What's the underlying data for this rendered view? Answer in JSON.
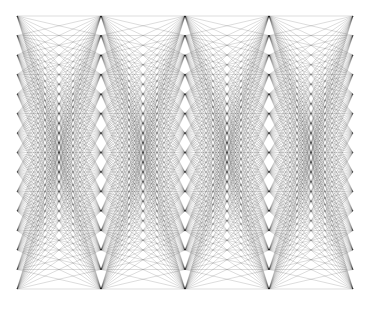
{
  "diagram": {
    "type": "layered-complete-bipartite-graph",
    "width": 367,
    "height": 318,
    "background": "#ffffff",
    "edge_color": "#000000",
    "edge_opacity": 0.28,
    "edge_width": 0.5,
    "layers_x": [
      17,
      101,
      185,
      269,
      353
    ],
    "nodes_per_layer": 15,
    "y_top": 16,
    "y_bottom": 289,
    "connectivity": "complete bipartite between each pair of adjacent layers"
  }
}
